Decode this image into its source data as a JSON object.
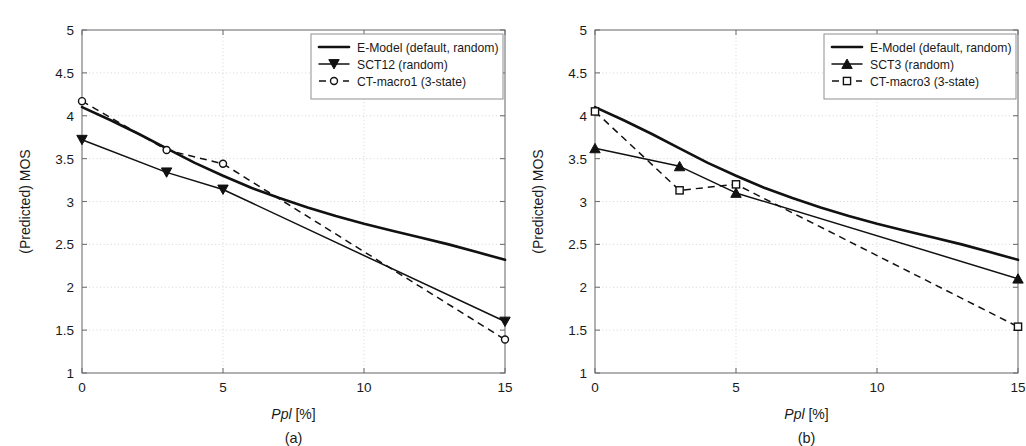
{
  "figure": {
    "background": "#ffffff",
    "line_color": "#111111",
    "grid_color": "#c9cbcd",
    "axis_color": "#6f7276"
  },
  "panels": [
    {
      "id": "a",
      "caption": "(a)",
      "xlabel_italic": "Ppl",
      "xlabel_rest": " [%]",
      "ylabel": "(Predicted) MOS",
      "xticks": [
        "0",
        "5",
        "10",
        "15"
      ],
      "yticks": [
        "1",
        "1.5",
        "2",
        "2.5",
        "3",
        "3.5",
        "4",
        "4.5",
        "5"
      ],
      "legend": [
        {
          "label": "E-Model (default, random)",
          "style": "solid-thick",
          "marker": "none"
        },
        {
          "label": "SCT12 (random)",
          "style": "solid-thin",
          "marker": "triangle-down"
        },
        {
          "label": "CT-macro1 (3-state)",
          "style": "dashed",
          "marker": "circle"
        }
      ]
    },
    {
      "id": "b",
      "caption": "(b)",
      "xlabel_italic": "Ppl",
      "xlabel_rest": " [%]",
      "ylabel": "(Predicted) MOS",
      "xticks": [
        "0",
        "5",
        "10",
        "15"
      ],
      "yticks": [
        "1",
        "1.5",
        "2",
        "2.5",
        "3",
        "3.5",
        "4",
        "4.5",
        "5"
      ],
      "legend": [
        {
          "label": "E-Model (default, random)",
          "style": "solid-thick",
          "marker": "none"
        },
        {
          "label": "SCT3 (random)",
          "style": "solid-thin",
          "marker": "triangle-up"
        },
        {
          "label": "CT-macro3 (3-state)",
          "style": "dashed",
          "marker": "square"
        }
      ]
    }
  ],
  "chart_data": [
    {
      "type": "line",
      "panel": "a",
      "title": "",
      "xlabel": "Ppl [%]",
      "ylabel": "(Predicted) MOS",
      "xlim": [
        0,
        15
      ],
      "ylim": [
        1,
        5
      ],
      "xticks": [
        0,
        5,
        10,
        15
      ],
      "yticks": [
        1,
        1.5,
        2,
        2.5,
        3,
        3.5,
        4,
        4.5,
        5
      ],
      "grid": true,
      "legend_position": "top-right",
      "series": [
        {
          "name": "E-Model (default, random)",
          "style": "solid-thick",
          "marker": "none",
          "x": [
            0,
            1,
            2,
            3,
            4,
            5,
            6,
            7,
            8,
            9,
            10,
            11,
            12,
            13,
            14,
            15
          ],
          "y": [
            4.1,
            3.95,
            3.79,
            3.62,
            3.45,
            3.3,
            3.16,
            3.04,
            2.93,
            2.83,
            2.74,
            2.66,
            2.58,
            2.5,
            2.41,
            2.32
          ]
        },
        {
          "name": "SCT12 (random)",
          "style": "solid-thin",
          "marker": "triangle-down",
          "x": [
            0,
            3,
            5,
            15
          ],
          "y": [
            3.72,
            3.34,
            3.14,
            1.6
          ]
        },
        {
          "name": "CT-macro1 (3-state)",
          "style": "dashed",
          "marker": "circle",
          "x": [
            0,
            3,
            5,
            15
          ],
          "y": [
            4.17,
            3.6,
            3.44,
            1.39
          ]
        }
      ]
    },
    {
      "type": "line",
      "panel": "b",
      "title": "",
      "xlabel": "Ppl [%]",
      "ylabel": "(Predicted) MOS",
      "xlim": [
        0,
        15
      ],
      "ylim": [
        1,
        5
      ],
      "xticks": [
        0,
        5,
        10,
        15
      ],
      "yticks": [
        1,
        1.5,
        2,
        2.5,
        3,
        3.5,
        4,
        4.5,
        5
      ],
      "grid": true,
      "legend_position": "top-right",
      "series": [
        {
          "name": "E-Model (default, random)",
          "style": "solid-thick",
          "marker": "none",
          "x": [
            0,
            1,
            2,
            3,
            4,
            5,
            6,
            7,
            8,
            9,
            10,
            11,
            12,
            13,
            14,
            15
          ],
          "y": [
            4.1,
            3.95,
            3.79,
            3.62,
            3.45,
            3.3,
            3.16,
            3.04,
            2.93,
            2.83,
            2.74,
            2.66,
            2.58,
            2.5,
            2.41,
            2.32
          ]
        },
        {
          "name": "SCT3 (random)",
          "style": "solid-thin",
          "marker": "triangle-up",
          "x": [
            0,
            3,
            5,
            15
          ],
          "y": [
            3.62,
            3.41,
            3.1,
            2.1
          ]
        },
        {
          "name": "CT-macro3 (3-state)",
          "style": "dashed",
          "marker": "square",
          "x": [
            0,
            3,
            5,
            15
          ],
          "y": [
            4.05,
            3.13,
            3.2,
            1.54
          ]
        }
      ]
    }
  ]
}
